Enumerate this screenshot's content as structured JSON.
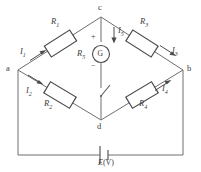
{
  "diagram": {
    "nodes": [
      {
        "id": "a",
        "label": "a"
      },
      {
        "id": "b",
        "label": "b"
      },
      {
        "id": "c",
        "label": "c"
      },
      {
        "id": "d",
        "label": "d"
      }
    ],
    "resistors": [
      {
        "id": "R1",
        "label": "R",
        "sub": "1"
      },
      {
        "id": "R2",
        "label": "R",
        "sub": "2"
      },
      {
        "id": "R3",
        "label": "R",
        "sub": "3"
      },
      {
        "id": "R4",
        "label": "R",
        "sub": "4"
      },
      {
        "id": "R5",
        "label": "R",
        "sub": "5"
      }
    ],
    "currents": [
      {
        "id": "I1",
        "label": "I",
        "sub": "1"
      },
      {
        "id": "I2",
        "label": "I",
        "sub": "2"
      },
      {
        "id": "I3",
        "label": "I",
        "sub": "3"
      },
      {
        "id": "I4",
        "label": "I",
        "sub": "4"
      },
      {
        "id": "I5",
        "label": "I",
        "sub": "5"
      }
    ],
    "galvanometer": {
      "symbol": "G",
      "plus": "+",
      "minus": "−"
    },
    "source": {
      "symbol": "E",
      "unit": "(V)"
    },
    "switch": {
      "name": "switch",
      "state": "open"
    },
    "colors": {
      "wire": "#6e6e6e",
      "component": "#4a4a4a",
      "text": "#3b3b3b",
      "background": "#ffffff"
    }
  }
}
